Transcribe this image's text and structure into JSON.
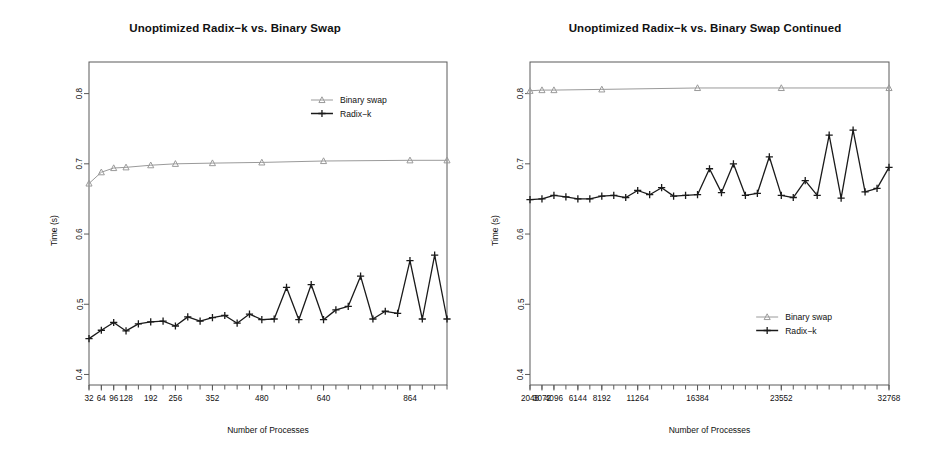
{
  "figure": {
    "background": "#ffffff",
    "panel_count": 2
  },
  "colors": {
    "binary_swap": "#9a9a9a",
    "radix_k": "#1a1a1a",
    "axis": "#5a5a5a",
    "text": "#111111"
  },
  "legend_labels": {
    "binary_swap": "Binary swap",
    "radix_k": "Radix−k"
  },
  "chart_data": [
    {
      "panel": "left",
      "type": "line",
      "title": "Unoptimized Radix−k vs. Binary Swap",
      "xlabel": "Number of Processes",
      "ylabel": "Time (s)",
      "grid": false,
      "legend_position": "top-right",
      "xscale": "categorical-ordinal",
      "ylim": [
        0.385,
        0.845
      ],
      "yticks": [
        0.4,
        0.5,
        0.6,
        0.7,
        0.8
      ],
      "ytick_labels": [
        "0.4",
        "0.5",
        "0.6",
        "0.7",
        "0.8"
      ],
      "xtick_labels": [
        "32",
        "64",
        "96",
        "128",
        "192",
        "256",
        "352",
        "480",
        "640",
        "864"
      ],
      "xtick_values": [
        32,
        64,
        96,
        128,
        192,
        256,
        352,
        480,
        640,
        864
      ],
      "x": [
        32,
        64,
        96,
        128,
        160,
        192,
        224,
        256,
        288,
        320,
        352,
        384,
        416,
        448,
        480,
        512,
        544,
        576,
        608,
        640,
        672,
        704,
        736,
        768,
        800,
        832,
        864,
        896,
        928,
        960
      ],
      "series": [
        {
          "name": "Binary swap",
          "marker": "triangle",
          "color": "#9a9a9a",
          "x": [
            32,
            64,
            96,
            128,
            192,
            256,
            352,
            480,
            640,
            864,
            960
          ],
          "values": [
            0.672,
            0.688,
            0.694,
            0.695,
            0.698,
            0.7,
            0.701,
            0.702,
            0.704,
            0.705,
            0.705
          ]
        },
        {
          "name": "Radix−k",
          "marker": "plus",
          "color": "#1a1a1a",
          "values": [
            0.451,
            0.463,
            0.474,
            0.462,
            0.472,
            0.475,
            0.476,
            0.469,
            0.482,
            0.476,
            0.481,
            0.484,
            0.473,
            0.486,
            0.478,
            0.479,
            0.524,
            0.478,
            0.528,
            0.478,
            0.492,
            0.497,
            0.54,
            0.479,
            0.49,
            0.487,
            0.562,
            0.479,
            0.57,
            0.479
          ]
        }
      ]
    },
    {
      "panel": "right",
      "type": "line",
      "title": "Unoptimized Radix−k vs. Binary Swap Continued",
      "xlabel": "Number of Processes",
      "ylabel": "Time (s)",
      "grid": false,
      "legend_position": "bottom-right",
      "xscale": "categorical-ordinal",
      "ylim": [
        0.385,
        0.845
      ],
      "yticks": [
        0.4,
        0.5,
        0.6,
        0.7,
        0.8
      ],
      "ytick_labels": [
        "0.4",
        "0.5",
        "0.6",
        "0.7",
        "0.8"
      ],
      "xtick_labels": [
        "2048",
        "3072",
        "4096",
        "6144",
        "8192",
        "11264",
        "16384",
        "23552",
        "32768"
      ],
      "xtick_values": [
        2048,
        3072,
        4096,
        6144,
        8192,
        11264,
        16384,
        23552,
        32768
      ],
      "x": [
        2048,
        3072,
        4096,
        5120,
        6144,
        7168,
        8192,
        9216,
        10240,
        11264,
        12288,
        13312,
        14336,
        15360,
        16384,
        17408,
        18432,
        19456,
        20480,
        21504,
        22528,
        23552,
        24576,
        25600,
        26624,
        27648,
        28672,
        29696,
        30720,
        31744,
        32768
      ],
      "series": [
        {
          "name": "Binary swap",
          "marker": "triangle",
          "color": "#9a9a9a",
          "x": [
            2048,
            3072,
            4096,
            8192,
            16384,
            23552,
            32768
          ],
          "values": [
            0.804,
            0.805,
            0.805,
            0.806,
            0.808,
            0.808,
            0.808
          ]
        },
        {
          "name": "Radix−k",
          "marker": "plus",
          "color": "#1a1a1a",
          "values": [
            0.649,
            0.65,
            0.655,
            0.653,
            0.65,
            0.65,
            0.654,
            0.655,
            0.652,
            0.662,
            0.656,
            0.666,
            0.654,
            0.655,
            0.656,
            0.693,
            0.659,
            0.7,
            0.655,
            0.658,
            0.71,
            0.655,
            0.652,
            0.676,
            0.655,
            0.741,
            0.651,
            0.748,
            0.66,
            0.665,
            0.695
          ]
        }
      ]
    }
  ]
}
